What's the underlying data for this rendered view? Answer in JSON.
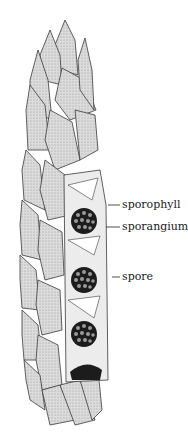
{
  "figure": {
    "labels": [
      {
        "text": "sporophyll",
        "x": 122,
        "y": 199,
        "line_from": [
          108,
          205
        ],
        "line_to": [
          120,
          205
        ]
      },
      {
        "text": "sporangium",
        "x": 122,
        "y": 221,
        "line_from": [
          106,
          227
        ],
        "line_to": [
          120,
          227
        ]
      },
      {
        "text": "spore",
        "x": 122,
        "y": 271,
        "line_from": [
          112,
          277
        ],
        "line_to": [
          120,
          277
        ]
      }
    ],
    "colors": {
      "scale_fill": "#d6d6d6",
      "scale_stroke": "#3a3a3a",
      "sporangium_fill": "#1c1c1c",
      "spore_fill": "#9a9a9a",
      "interior_fill": "#ececec"
    }
  }
}
